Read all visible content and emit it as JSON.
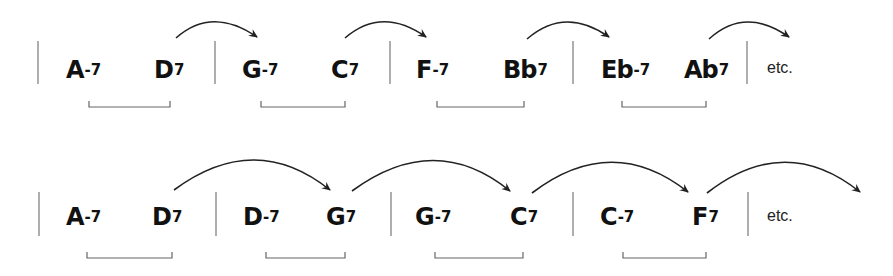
{
  "diagram": {
    "rows": [
      {
        "measures": [
          {
            "chords": [
              {
                "root": "A",
                "quality": "-7"
              },
              {
                "root": "D",
                "quality": "7"
              }
            ]
          },
          {
            "chords": [
              {
                "root": "G",
                "quality": "-7"
              },
              {
                "root": "C",
                "quality": "7"
              }
            ]
          },
          {
            "chords": [
              {
                "root": "F",
                "quality": "-7"
              },
              {
                "root": "Bb",
                "quality": "7"
              }
            ]
          },
          {
            "chords": [
              {
                "root": "Eb",
                "quality": "-7"
              },
              {
                "root": "Ab",
                "quality": "7"
              }
            ]
          }
        ],
        "ending": "etc.",
        "arrows": [
          "D7 → G-7",
          "C7 → F-7",
          "Bb7 → Eb-7",
          "Ab7 → next"
        ],
        "brackets": [
          "A-7 D7",
          "G-7 C7",
          "F-7 Bb7",
          "Eb-7 Ab7"
        ]
      },
      {
        "measures": [
          {
            "chords": [
              {
                "root": "A",
                "quality": "-7"
              },
              {
                "root": "D",
                "quality": "7"
              }
            ]
          },
          {
            "chords": [
              {
                "root": "D",
                "quality": "-7"
              },
              {
                "root": "G",
                "quality": "7"
              }
            ]
          },
          {
            "chords": [
              {
                "root": "G",
                "quality": "-7"
              },
              {
                "root": "C",
                "quality": "7"
              }
            ]
          },
          {
            "chords": [
              {
                "root": "C",
                "quality": "-7"
              },
              {
                "root": "F",
                "quality": "7"
              }
            ]
          }
        ],
        "ending": "etc.",
        "arrows": [
          "D7 → G7",
          "G7 → C7",
          "C7 → F7",
          "F7 → next"
        ],
        "brackets": [
          "A-7 D7",
          "D-7 G7",
          "G-7 C7",
          "C-7 F7"
        ]
      }
    ]
  },
  "labels": {
    "r1": {
      "c1": {
        "root": "A",
        "qual": "-7"
      },
      "c2": {
        "root": "D",
        "qual": "7"
      },
      "c3": {
        "root": "G",
        "qual": "-7"
      },
      "c4": {
        "root": "C",
        "qual": "7"
      },
      "c5": {
        "root": "F",
        "qual": "-7"
      },
      "c6": {
        "root": "Bb",
        "qual": "7"
      },
      "c7": {
        "root": "Eb",
        "qual": "-7"
      },
      "c8": {
        "root": "Ab",
        "qual": "7"
      },
      "etc": "etc."
    },
    "r2": {
      "c1": {
        "root": "A",
        "qual": "-7"
      },
      "c2": {
        "root": "D",
        "qual": "7"
      },
      "c3": {
        "root": "D",
        "qual": "-7"
      },
      "c4": {
        "root": "G",
        "qual": "7"
      },
      "c5": {
        "root": "G",
        "qual": "-7"
      },
      "c6": {
        "root": "C",
        "qual": "7"
      },
      "c7": {
        "root": "C",
        "qual": "-7"
      },
      "c8": {
        "root": "F",
        "qual": "7"
      },
      "etc": "etc."
    }
  },
  "colors": {
    "ink": "#111111",
    "barline": "#777777",
    "bracket": "#666666",
    "arrow": "#222222"
  }
}
